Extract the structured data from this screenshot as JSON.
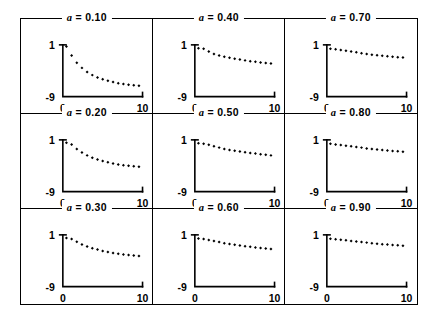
{
  "figure": {
    "kind": "trellis-of-scatter-plots",
    "rows": 3,
    "cols": 3,
    "marker_shape": "filled-diamond"
  },
  "axes": {
    "xlabel": "",
    "ylabel": "",
    "xlim": [
      0,
      10
    ],
    "ylim": [
      -9,
      1
    ],
    "x_tick_labels": [
      "0",
      "10"
    ],
    "x_tick_values": [
      0,
      10
    ],
    "y_tick_labels": [
      "1",
      "-9"
    ],
    "y_tick_values": [
      1,
      -9
    ],
    "grid": false
  },
  "chart_data": [
    {
      "type": "scatter",
      "title": "a = 0.10",
      "param_symbol": "a",
      "param_value": "0.10",
      "xlabel": "",
      "ylabel": "",
      "xlim": [
        0,
        10
      ],
      "ylim": [
        -9,
        1
      ],
      "x": [
        0.45,
        1.1,
        1.75,
        2.4,
        3.05,
        3.7,
        4.35,
        5.0,
        5.65,
        6.3,
        6.95,
        7.6,
        8.25,
        8.9,
        9.55
      ],
      "y": [
        0.7,
        -1.05,
        -2.45,
        -3.45,
        -4.25,
        -4.85,
        -5.3,
        -5.65,
        -5.95,
        -6.2,
        -6.4,
        -6.55,
        -6.7,
        -6.8,
        -6.9
      ]
    },
    {
      "type": "scatter",
      "title": "a = 0.40",
      "param_symbol": "a",
      "param_value": "0.40",
      "xlabel": "",
      "ylabel": "",
      "xlim": [
        0,
        10
      ],
      "ylim": [
        -9,
        1
      ],
      "x": [
        0.45,
        1.1,
        1.75,
        2.4,
        3.05,
        3.7,
        4.35,
        5.0,
        5.65,
        6.3,
        6.95,
        7.6,
        8.25,
        8.9,
        9.55
      ],
      "y": [
        0.35,
        0.25,
        -0.3,
        -0.75,
        -1.05,
        -1.3,
        -1.5,
        -1.7,
        -1.85,
        -2.0,
        -2.15,
        -2.25,
        -2.4,
        -2.5,
        -2.6
      ]
    },
    {
      "type": "scatter",
      "title": "a = 0.70",
      "param_symbol": "a",
      "param_value": "0.70",
      "xlabel": "",
      "ylabel": "",
      "xlim": [
        0,
        10
      ],
      "ylim": [
        -9,
        1
      ],
      "x": [
        0.45,
        1.1,
        1.75,
        2.4,
        3.05,
        3.7,
        4.35,
        5.0,
        5.65,
        6.3,
        6.95,
        7.6,
        8.25,
        8.9,
        9.55
      ],
      "y": [
        0.25,
        0.15,
        0.0,
        -0.15,
        -0.3,
        -0.45,
        -0.6,
        -0.75,
        -0.9,
        -1.0,
        -1.1,
        -1.2,
        -1.3,
        -1.4,
        -1.45
      ]
    },
    {
      "type": "scatter",
      "title": "a = 0.20",
      "param_symbol": "a",
      "param_value": "0.20",
      "xlabel": "",
      "ylabel": "",
      "xlim": [
        0,
        10
      ],
      "ylim": [
        -9,
        1
      ],
      "x": [
        0.45,
        1.1,
        1.75,
        2.4,
        3.05,
        3.7,
        4.35,
        5.0,
        5.65,
        6.3,
        6.95,
        7.6,
        8.25,
        8.9,
        9.55
      ],
      "y": [
        0.45,
        0.1,
        -0.75,
        -1.45,
        -2.0,
        -2.45,
        -2.8,
        -3.1,
        -3.35,
        -3.55,
        -3.75,
        -3.9,
        -4.0,
        -4.1,
        -4.2
      ]
    },
    {
      "type": "scatter",
      "title": "a = 0.50",
      "param_symbol": "a",
      "param_value": "0.50",
      "xlabel": "",
      "ylabel": "",
      "xlim": [
        0,
        10
      ],
      "ylim": [
        -9,
        1
      ],
      "x": [
        0.45,
        1.1,
        1.75,
        2.4,
        3.05,
        3.7,
        4.35,
        5.0,
        5.65,
        6.3,
        6.95,
        7.6,
        8.25,
        8.9,
        9.55
      ],
      "y": [
        0.35,
        0.25,
        0.05,
        -0.25,
        -0.5,
        -0.75,
        -0.95,
        -1.1,
        -1.25,
        -1.4,
        -1.55,
        -1.65,
        -1.8,
        -1.9,
        -2.0
      ]
    },
    {
      "type": "scatter",
      "title": "a = 0.80",
      "param_symbol": "a",
      "param_value": "0.80",
      "xlabel": "",
      "ylabel": "",
      "xlim": [
        0,
        10
      ],
      "ylim": [
        -9,
        1
      ],
      "x": [
        0.45,
        1.1,
        1.75,
        2.4,
        3.05,
        3.7,
        4.35,
        5.0,
        5.65,
        6.3,
        6.95,
        7.6,
        8.25,
        8.9,
        9.55
      ],
      "y": [
        0.25,
        0.1,
        0.0,
        -0.15,
        -0.25,
        -0.4,
        -0.5,
        -0.65,
        -0.75,
        -0.85,
        -0.95,
        -1.05,
        -1.15,
        -1.2,
        -1.3
      ]
    },
    {
      "type": "scatter",
      "title": "a = 0.30",
      "param_symbol": "a",
      "param_value": "0.30",
      "xlabel": "",
      "ylabel": "",
      "xlim": [
        0,
        10
      ],
      "ylim": [
        -9,
        1
      ],
      "x": [
        0.45,
        1.1,
        1.75,
        2.4,
        3.05,
        3.7,
        4.35,
        5.0,
        5.65,
        6.3,
        6.95,
        7.6,
        8.25,
        8.9,
        9.55
      ],
      "y": [
        0.4,
        0.2,
        -0.35,
        -0.85,
        -1.25,
        -1.6,
        -1.85,
        -2.1,
        -2.3,
        -2.5,
        -2.65,
        -2.8,
        -2.9,
        -3.0,
        -3.1
      ]
    },
    {
      "type": "scatter",
      "title": "a = 0.60",
      "param_symbol": "a",
      "param_value": "0.60",
      "xlabel": "",
      "ylabel": "",
      "xlim": [
        0,
        10
      ],
      "ylim": [
        -9,
        1
      ],
      "x": [
        0.45,
        1.1,
        1.75,
        2.4,
        3.05,
        3.7,
        4.35,
        5.0,
        5.65,
        6.3,
        6.95,
        7.6,
        8.25,
        8.9,
        9.55
      ],
      "y": [
        0.3,
        0.2,
        0.0,
        -0.2,
        -0.4,
        -0.6,
        -0.75,
        -0.9,
        -1.05,
        -1.2,
        -1.3,
        -1.45,
        -1.55,
        -1.65,
        -1.75
      ]
    },
    {
      "type": "scatter",
      "title": "a = 0.90",
      "param_symbol": "a",
      "param_value": "0.90",
      "xlabel": "",
      "ylabel": "",
      "xlim": [
        0,
        10
      ],
      "ylim": [
        -9,
        1
      ],
      "x": [
        0.45,
        1.1,
        1.75,
        2.4,
        3.05,
        3.7,
        4.35,
        5.0,
        5.65,
        6.3,
        6.95,
        7.6,
        8.25,
        8.9,
        9.55
      ],
      "y": [
        0.25,
        0.15,
        0.05,
        -0.05,
        -0.2,
        -0.3,
        -0.4,
        -0.5,
        -0.6,
        -0.7,
        -0.8,
        -0.85,
        -0.95,
        -1.0,
        -1.1
      ]
    }
  ]
}
